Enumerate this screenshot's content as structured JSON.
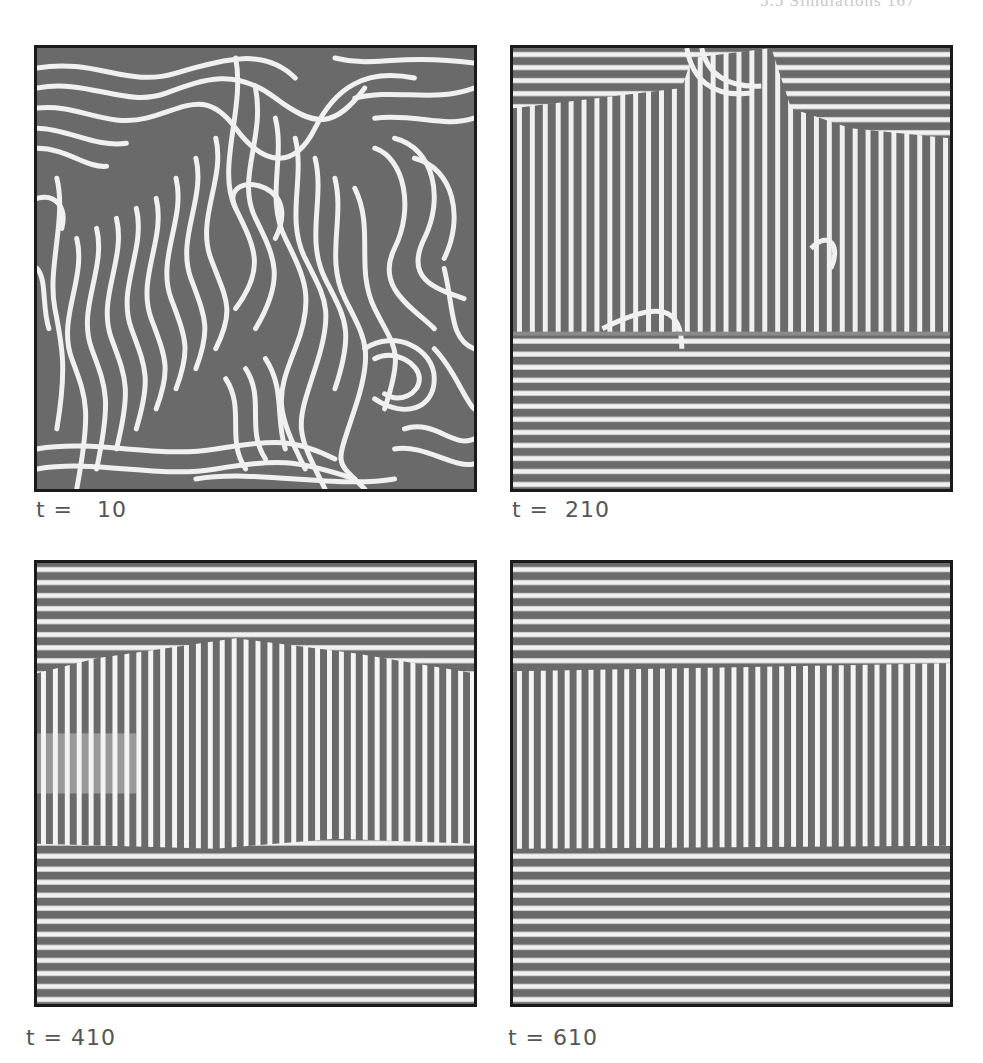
{
  "page": {
    "running_header": "5.5 Simulations    167"
  },
  "figure": {
    "panels": [
      {
        "id": "p1",
        "label": "t =   10",
        "time": 10,
        "pattern": "labyrinth"
      },
      {
        "id": "p2",
        "label": "t =  210",
        "time": 210,
        "pattern": "mixed-domains"
      },
      {
        "id": "p3",
        "label": "t = 410",
        "time": 410,
        "pattern": "vertical-band"
      },
      {
        "id": "p4",
        "label": "t = 610",
        "time": 610,
        "pattern": "vertical-band-straight"
      }
    ],
    "colors": {
      "stripe_light": "#f2f2f2",
      "stripe_dark": "#6a6a6a",
      "border": "#1a1a1a"
    }
  }
}
